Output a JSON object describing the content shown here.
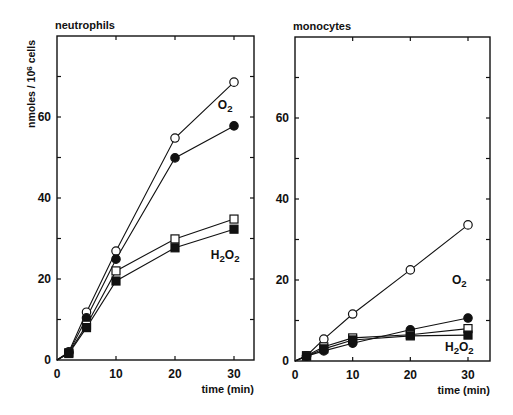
{
  "figure": {
    "ylabel": "nmoles / 10",
    "ylabel_sup": "6",
    "ylabel_tail": " cells",
    "xlabel": "time (min)"
  },
  "chart_data": [
    {
      "type": "line",
      "title": "neutrophils",
      "xlabel": "time (min)",
      "ylabel": "nmoles/10^6 cells",
      "xlim": [
        0,
        33
      ],
      "ylim": [
        0,
        80
      ],
      "xticks": [
        0,
        10,
        20,
        30
      ],
      "yticks_labeled": [
        0,
        20,
        40,
        60
      ],
      "yticks_minor": [
        10,
        30,
        50,
        70
      ],
      "grid": false,
      "x": [
        2,
        5,
        10,
        20,
        30
      ],
      "series": [
        {
          "name": "O2 (open circles)",
          "marker": "open-circle",
          "values": [
            2,
            11.8,
            26.9,
            54.8,
            68.6
          ]
        },
        {
          "name": "O2 (filled circles)",
          "marker": "filled-circle",
          "values": [
            1.8,
            10.4,
            24.9,
            49.9,
            57.8
          ]
        },
        {
          "name": "H2O2 (open squares)",
          "marker": "open-square",
          "values": [
            1.8,
            8.6,
            22.0,
            29.9,
            34.8
          ]
        },
        {
          "name": "H2O2 (filled squares)",
          "marker": "filled-square",
          "values": [
            1.6,
            8.0,
            19.5,
            27.7,
            32.3
          ]
        }
      ],
      "annotations": [
        {
          "text": "O",
          "sub": "2",
          "x": 28.5,
          "y": 62
        },
        {
          "text": "H",
          "sub": "2",
          "text2": "O",
          "sub2": "2",
          "x": 28.5,
          "y": 25
        }
      ]
    },
    {
      "type": "line",
      "title": "monocytes",
      "xlabel": "time (min)",
      "ylabel": "",
      "xlim": [
        0,
        33
      ],
      "ylim": [
        0,
        80
      ],
      "xticks": [
        0,
        10,
        20,
        30
      ],
      "yticks_labeled": [
        0,
        20,
        40,
        60
      ],
      "yticks_minor": [
        10,
        30,
        50,
        70
      ],
      "grid": false,
      "x": [
        2,
        5,
        10,
        20,
        30
      ],
      "series": [
        {
          "name": "O2 (open circles)",
          "marker": "open-circle",
          "values": [
            1.3,
            5.4,
            11.6,
            22.5,
            33.6
          ]
        },
        {
          "name": "O2 (filled circles)",
          "marker": "filled-circle",
          "values": [
            1.2,
            2.5,
            4.4,
            7.7,
            10.6
          ]
        },
        {
          "name": "H2O2 (open squares)",
          "marker": "open-square",
          "values": [
            1.3,
            3.5,
            5.7,
            6.5,
            8.0
          ]
        },
        {
          "name": "H2O2 (filled squares)",
          "marker": "filled-square",
          "values": [
            1.2,
            3.0,
            5.2,
            6.2,
            6.4
          ]
        }
      ],
      "annotations": [
        {
          "text": "O",
          "sub": "2",
          "x": 28.5,
          "y": 19
        },
        {
          "text": "H",
          "sub": "2",
          "text2": "O",
          "sub2": "2",
          "x": 28.5,
          "y": 2.5
        }
      ]
    }
  ],
  "layout": {
    "panels": [
      {
        "left": 57,
        "right": 254,
        "top": 36,
        "bottom": 360,
        "x30px": 234,
        "show_ylabel": true
      },
      {
        "left": 295,
        "right": 490,
        "top": 37,
        "bottom": 361,
        "x30px": 468,
        "show_ylabel": false
      }
    ],
    "ink": "#111111"
  }
}
